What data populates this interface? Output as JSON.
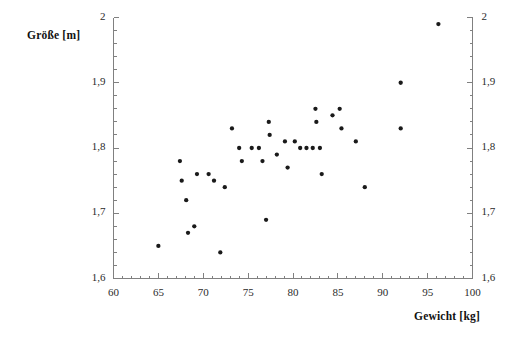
{
  "chart_data": {
    "type": "scatter",
    "title": "",
    "xlabel": "Gewicht [kg]",
    "ylabel": "Größe [m]",
    "xlim": [
      60,
      100
    ],
    "ylim": [
      1.6,
      2.0
    ],
    "xticks": [
      60,
      65,
      70,
      75,
      80,
      85,
      90,
      95,
      100
    ],
    "xticklabels": [
      "60",
      "65",
      "70",
      "75",
      "80",
      "85",
      "90",
      "95",
      "100"
    ],
    "yticks": [
      1.6,
      1.7,
      1.8,
      1.9,
      2.0
    ],
    "yticklabels": [
      "1,6",
      "1,7",
      "1,8",
      "1,9",
      "2"
    ],
    "x_minor_tick_step": 1,
    "y_minor_tick_step": 0.02,
    "grid": false,
    "legend": null,
    "right_axis_mirrored": true,
    "marker_color": "#1a1a1a",
    "axis_color": "#808080",
    "series": [
      {
        "name": "Personen",
        "points": [
          [
            65.0,
            1.65
          ],
          [
            67.4,
            1.78
          ],
          [
            67.6,
            1.75
          ],
          [
            68.1,
            1.72
          ],
          [
            68.3,
            1.67
          ],
          [
            69.0,
            1.68
          ],
          [
            69.3,
            1.76
          ],
          [
            70.6,
            1.76
          ],
          [
            71.2,
            1.75
          ],
          [
            71.9,
            1.64
          ],
          [
            72.4,
            1.74
          ],
          [
            73.2,
            1.83
          ],
          [
            74.0,
            1.8
          ],
          [
            74.3,
            1.78
          ],
          [
            75.4,
            1.8
          ],
          [
            76.2,
            1.8
          ],
          [
            76.6,
            1.78
          ],
          [
            77.0,
            1.69
          ],
          [
            77.3,
            1.84
          ],
          [
            77.4,
            1.82
          ],
          [
            78.2,
            1.79
          ],
          [
            79.1,
            1.81
          ],
          [
            79.4,
            1.77
          ],
          [
            80.2,
            1.81
          ],
          [
            80.8,
            1.8
          ],
          [
            81.5,
            1.8
          ],
          [
            82.2,
            1.8
          ],
          [
            82.5,
            1.86
          ],
          [
            82.6,
            1.84
          ],
          [
            83.0,
            1.8
          ],
          [
            83.2,
            1.76
          ],
          [
            84.4,
            1.85
          ],
          [
            85.2,
            1.86
          ],
          [
            85.4,
            1.83
          ],
          [
            87.0,
            1.81
          ],
          [
            88.0,
            1.74
          ],
          [
            92.0,
            1.83
          ],
          [
            92.0,
            1.9
          ],
          [
            96.2,
            1.99
          ]
        ]
      }
    ]
  }
}
